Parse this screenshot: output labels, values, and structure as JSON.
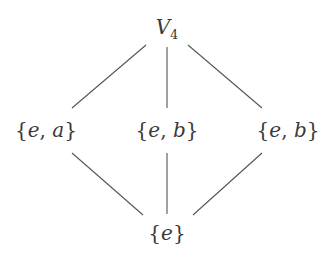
{
  "diagram": {
    "nodes": {
      "top": {
        "label": "V",
        "subscript": "4"
      },
      "left": {
        "open": "{",
        "e": "e",
        "sep": ", ",
        "elem": "a",
        "close": "}",
        "text": "{e, a}"
      },
      "middle": {
        "open": "{",
        "e": "e",
        "sep": ", ",
        "elem": "b",
        "close": "}",
        "text": "{e, b}"
      },
      "right": {
        "open": "{",
        "e": "e",
        "sep": ", ",
        "elem": "b",
        "close": "}",
        "text": "{e, b}"
      },
      "bottom": {
        "open": "{",
        "e": "e",
        "close": "}",
        "text": "{e}"
      }
    },
    "edges": [
      {
        "from": "top",
        "to": "left"
      },
      {
        "from": "top",
        "to": "middle"
      },
      {
        "from": "top",
        "to": "right"
      },
      {
        "from": "left",
        "to": "bottom"
      },
      {
        "from": "middle",
        "to": "bottom"
      },
      {
        "from": "right",
        "to": "bottom"
      }
    ]
  }
}
